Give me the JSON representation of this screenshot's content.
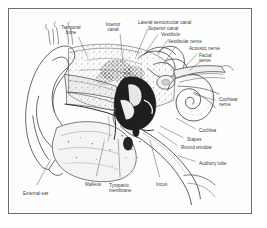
{
  "figure": {
    "type": "labeled-anatomical-diagram",
    "frame_color": "#6e6e6e",
    "background_color": "#ffffff",
    "ink_color": "#3a3a3a"
  },
  "labels": [
    {
      "id": "temporal-bone",
      "text": "Temporal\nbone",
      "x": 62,
      "y": 16,
      "align": "center"
    },
    {
      "id": "inferior-canal",
      "text": "Interior\ncanal",
      "x": 104,
      "y": 13,
      "align": "center"
    },
    {
      "id": "lateral-semicircular-canal",
      "text": "Lateral semicircular canal",
      "x": 129,
      "y": 11,
      "align": "left"
    },
    {
      "id": "superior-canal",
      "text": "Superior canal",
      "x": 139,
      "y": 17,
      "align": "left"
    },
    {
      "id": "vestibule",
      "text": "Vestibule",
      "x": 152,
      "y": 23,
      "align": "left"
    },
    {
      "id": "vestibular-nerve",
      "text": "Vestibular nerve",
      "x": 159,
      "y": 30,
      "align": "left"
    },
    {
      "id": "acoustic-nerve",
      "text": "Acoustic nerve",
      "x": 180,
      "y": 37,
      "align": "left"
    },
    {
      "id": "facial-nerve",
      "text": "Facial\nnerve",
      "x": 190,
      "y": 44,
      "align": "left"
    },
    {
      "id": "cochlear-nerve",
      "text": "Cochlear\nnerve",
      "x": 210,
      "y": 88,
      "align": "left"
    },
    {
      "id": "cochlea",
      "text": "Cochlea",
      "x": 190,
      "y": 119,
      "align": "left"
    },
    {
      "id": "stapes",
      "text": "Stapes",
      "x": 178,
      "y": 128,
      "align": "left"
    },
    {
      "id": "round-window",
      "text": "Round window",
      "x": 172,
      "y": 136,
      "align": "left"
    },
    {
      "id": "auditory-tube",
      "text": "Auditory tube",
      "x": 190,
      "y": 152,
      "align": "left"
    },
    {
      "id": "incus",
      "text": "Incus",
      "x": 147,
      "y": 173,
      "align": "left"
    },
    {
      "id": "tympanic-membrane",
      "text": "Tympanic\nmembrane",
      "x": 100,
      "y": 174,
      "align": "left"
    },
    {
      "id": "malleus",
      "text": "Malleus",
      "x": 76,
      "y": 173,
      "align": "left"
    },
    {
      "id": "external-ear",
      "text": "External ear",
      "x": 14,
      "y": 182,
      "align": "left"
    }
  ],
  "leader_lines": [
    {
      "id": "leader-temporal-bone",
      "from": [
        70,
        28
      ],
      "to": [
        79,
        48
      ]
    },
    {
      "id": "leader-inferior-canal",
      "from": [
        112,
        25
      ],
      "to": [
        115,
        55
      ]
    },
    {
      "id": "leader-lateral-semicircular-canal",
      "from": [
        140,
        20
      ],
      "to": [
        128,
        48
      ]
    },
    {
      "id": "leader-superior-canal",
      "from": [
        150,
        26
      ],
      "to": [
        137,
        45
      ]
    },
    {
      "id": "leader-vestibule",
      "from": [
        160,
        31
      ],
      "to": [
        150,
        47
      ]
    },
    {
      "id": "leader-vestibular-nerve",
      "from": [
        168,
        38
      ],
      "to": [
        155,
        56
      ]
    },
    {
      "id": "leader-acoustic-nerve",
      "from": [
        190,
        45
      ],
      "to": [
        178,
        58
      ]
    },
    {
      "id": "leader-facial-nerve",
      "from": [
        194,
        52
      ],
      "to": [
        182,
        62
      ]
    },
    {
      "id": "leader-cochlear-nerve",
      "from": [
        208,
        92
      ],
      "to": [
        186,
        86
      ]
    },
    {
      "id": "leader-cochlea",
      "from": [
        188,
        121
      ],
      "to": [
        168,
        110
      ]
    },
    {
      "id": "leader-stapes",
      "from": [
        176,
        130
      ],
      "to": [
        152,
        118
      ]
    },
    {
      "id": "leader-round-window",
      "from": [
        170,
        138
      ],
      "to": [
        150,
        124
      ]
    },
    {
      "id": "leader-auditory-tube",
      "from": [
        188,
        154
      ],
      "to": [
        170,
        148
      ]
    },
    {
      "id": "leader-incus",
      "from": [
        152,
        170
      ],
      "to": [
        142,
        132
      ]
    },
    {
      "id": "leader-tympanic-membrane",
      "from": [
        112,
        170
      ],
      "to": [
        110,
        131
      ]
    },
    {
      "id": "leader-malleus",
      "from": [
        88,
        169
      ],
      "to": [
        96,
        134
      ]
    },
    {
      "id": "leader-external-ear",
      "from": [
        28,
        178
      ],
      "to": [
        42,
        152
      ]
    }
  ],
  "structures": [
    {
      "id": "auricle-pinna",
      "name": "Auricle (pinna) outline"
    },
    {
      "id": "external-ear-canal",
      "name": "External auditory canal"
    },
    {
      "id": "temporal-bone-mass",
      "name": "Temporal bone spongy mass"
    },
    {
      "id": "middle-ear-ossicles",
      "name": "Malleus, incus and stapes"
    },
    {
      "id": "cochlea-spiral",
      "name": "Cochlear spiral"
    },
    {
      "id": "semicircular-canals",
      "name": "Semicircular canal loops"
    },
    {
      "id": "auditory-tube-duct",
      "name": "Eustachian (auditory) tube"
    },
    {
      "id": "mandible-condyle",
      "name": "Mandibular condyle region"
    }
  ]
}
